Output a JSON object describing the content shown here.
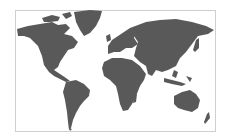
{
  "map": {
    "type": "world-map",
    "projection": "equirectangular-like",
    "land_color": "#595959",
    "water_color": "#ffffff",
    "frame_color": "#cfcfcf",
    "regions": [
      {
        "id": "north-america",
        "label": "North America"
      },
      {
        "id": "greenland",
        "label": "Greenland"
      },
      {
        "id": "south-america",
        "label": "South America"
      },
      {
        "id": "europe",
        "label": "Europe"
      },
      {
        "id": "africa",
        "label": "Africa"
      },
      {
        "id": "asia",
        "label": "Asia"
      },
      {
        "id": "australia",
        "label": "Australia"
      },
      {
        "id": "madagascar",
        "label": "Madagascar"
      },
      {
        "id": "new-zealand",
        "label": "New Zealand"
      },
      {
        "id": "japan",
        "label": "Japan"
      },
      {
        "id": "uk",
        "label": "United Kingdom"
      },
      {
        "id": "indonesia",
        "label": "Indonesia"
      }
    ]
  }
}
